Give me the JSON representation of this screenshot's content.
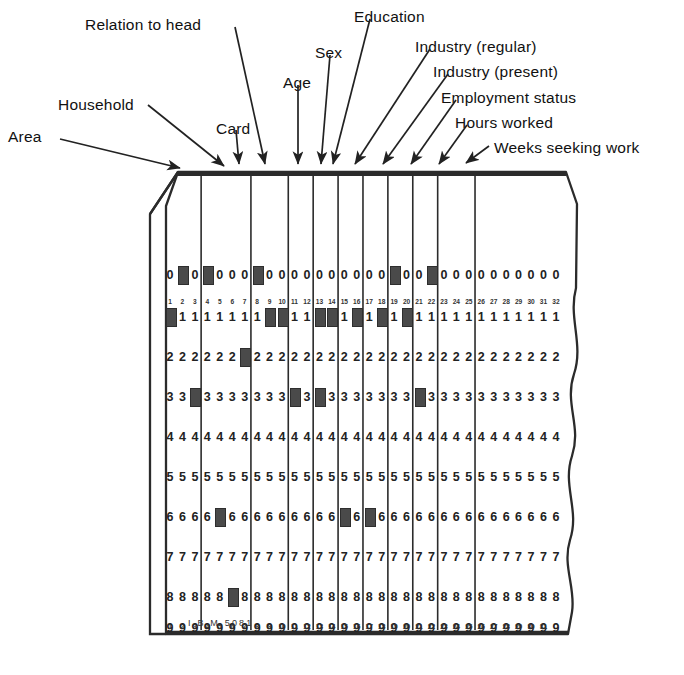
{
  "figure": {
    "card_imprint": "I B M  5081"
  },
  "callouts": [
    {
      "label": "Area",
      "lx": 8,
      "ly": 128,
      "x1": 60,
      "y1": 139,
      "x2": 180,
      "y2": 168
    },
    {
      "label": "Household",
      "lx": 58,
      "ly": 96,
      "x1": 148,
      "y1": 105,
      "x2": 224,
      "y2": 166
    },
    {
      "label": "Card",
      "lx": 216,
      "ly": 120,
      "x1": 236,
      "y1": 130,
      "x2": 239,
      "y2": 164
    },
    {
      "label": "Relation to head",
      "lx": 85,
      "ly": 16,
      "x1": 235,
      "y1": 27,
      "x2": 265,
      "y2": 164
    },
    {
      "label": "Age",
      "lx": 283,
      "ly": 74,
      "x1": 298,
      "y1": 85,
      "x2": 298,
      "y2": 164
    },
    {
      "label": "Sex",
      "lx": 315,
      "ly": 44,
      "x1": 330,
      "y1": 55,
      "x2": 321,
      "y2": 164
    },
    {
      "label": "Education",
      "lx": 354,
      "ly": 8,
      "x1": 370,
      "y1": 19,
      "x2": 333,
      "y2": 164
    },
    {
      "label": "Industry (regular)",
      "lx": 415,
      "ly": 38,
      "x1": 430,
      "y1": 49,
      "x2": 355,
      "y2": 164
    },
    {
      "label": "Industry (present)",
      "lx": 433,
      "ly": 63,
      "x1": 448,
      "y1": 74,
      "x2": 383,
      "y2": 164
    },
    {
      "label": "Employment status",
      "lx": 441,
      "ly": 89,
      "x1": 456,
      "y1": 100,
      "x2": 411,
      "y2": 164
    },
    {
      "label": "Hours worked",
      "lx": 455,
      "ly": 114,
      "x1": 467,
      "y1": 125,
      "x2": 439,
      "y2": 164
    },
    {
      "label": "Weeks seeking work",
      "lx": 494,
      "ly": 139,
      "x1": 489,
      "y1": 146,
      "x2": 466,
      "y2": 163
    }
  ],
  "chart_data": {
    "type": "table",
    "columns": 32,
    "rows": [
      "0",
      "1",
      "2",
      "3",
      "4",
      "5",
      "6",
      "7",
      "8",
      "9"
    ],
    "column_numbers": [
      "1",
      "2",
      "3",
      "4",
      "5",
      "6",
      "7",
      "8",
      "9",
      "10",
      "11",
      "12",
      "13",
      "14",
      "15",
      "16",
      "17",
      "18",
      "19",
      "20",
      "21",
      "22",
      "23",
      "24",
      "25",
      "26",
      "27",
      "28",
      "29",
      "30",
      "31",
      "32"
    ],
    "field_dividers_after_column": [
      3,
      7,
      10,
      12,
      14,
      16,
      18,
      20,
      22,
      25
    ],
    "punches": {
      "0": [
        2,
        4,
        8,
        19,
        22
      ],
      "1": [
        1,
        9,
        10,
        13,
        14,
        16,
        18,
        20
      ],
      "2": [
        7
      ],
      "3": [
        3,
        11,
        13,
        21
      ],
      "4": [],
      "5": [],
      "6": [
        5,
        15,
        17
      ],
      "7": [],
      "8": [
        6
      ],
      "9": []
    },
    "xlabel": "Card column",
    "ylabel": "Punch row",
    "legend": [],
    "grid": true
  }
}
